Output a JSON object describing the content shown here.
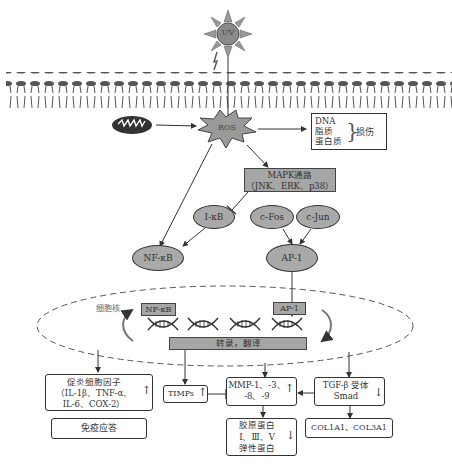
{
  "diagram": {
    "uv": {
      "label": "UV"
    },
    "ros": {
      "label": "ROS"
    },
    "damage": {
      "items": [
        "DNA",
        "脂质",
        "蛋白质"
      ],
      "result": "损伤"
    },
    "mapk": {
      "line1": "MAPK通路",
      "line2": "（JNK、ERK、p38）"
    },
    "ikb": {
      "label": "I-κB"
    },
    "nfkb": {
      "label": "NF-κB"
    },
    "cfos": {
      "label": "c-Fos"
    },
    "cjun": {
      "label": "c-Jun"
    },
    "ap1": {
      "label": "AP-1"
    },
    "nucleus": {
      "label": "细胞核",
      "nfkb_box": "NF-κB",
      "ap1_box": "AP-1",
      "transcription": "转录，翻译"
    },
    "cytokines": {
      "line1": "促炎细胞因子",
      "line2": "（IL-1β、TNF-α、",
      "line3": "IL-6、COX-2）",
      "arrow": "↑"
    },
    "immune": {
      "label": "免疫应答"
    },
    "timps": {
      "label": "TIMPs",
      "arrow": "↑"
    },
    "mmp": {
      "line1": "MMP-1、-3、",
      "line2": "-8、-9",
      "arrow": "↑"
    },
    "tgf": {
      "line1": "TGF-β 受体",
      "line2": "Smad",
      "arrow": "↓"
    },
    "collagen_proteins": {
      "line1": "胶原蛋白",
      "line2": "Ⅰ、Ⅲ、Ⅴ",
      "line3": "弹性蛋白",
      "arrow": "↓"
    },
    "col_genes": {
      "label": "COL1A1、COL3A1"
    },
    "colors": {
      "node_fill": "#a9a9a9",
      "line": "#333333",
      "membrane": "#555555"
    }
  }
}
